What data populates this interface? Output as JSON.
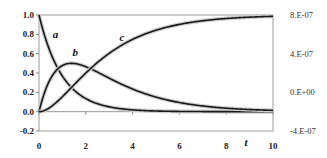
{
  "chart_data": {
    "type": "line",
    "title": "",
    "xlabel": "t",
    "ylabel": "",
    "xlim": [
      0,
      10
    ],
    "ylim": [
      -0.2,
      1.0
    ],
    "y2lim": [
      -4e-07,
      8e-07
    ],
    "x_ticks": [
      "0",
      "2",
      "4",
      "6",
      "8",
      "10"
    ],
    "y_ticks": [
      "1.0",
      "0.8",
      "0.6",
      "0.4",
      "0.2",
      "0.0",
      "-0.2"
    ],
    "y2_ticks": [
      "8.E-07",
      "4.E-07",
      "0.E+00",
      "-4.E-07"
    ],
    "grid": false,
    "legend": "inline labels",
    "x": [
      0,
      0.25,
      0.5,
      0.75,
      1,
      1.25,
      1.5,
      1.75,
      2,
      2.5,
      3,
      3.5,
      4,
      4.5,
      5,
      5.5,
      6,
      6.5,
      7,
      7.5,
      8,
      8.5,
      9,
      9.5,
      10
    ],
    "series": [
      {
        "name": "a",
        "values": [
          1.0,
          0.779,
          0.607,
          0.472,
          0.368,
          0.287,
          0.223,
          0.174,
          0.135,
          0.082,
          0.05,
          0.03,
          0.018,
          0.011,
          0.007,
          0.004,
          0.002,
          0.002,
          0.001,
          0.001,
          0.0,
          0.0,
          0.0,
          0.0,
          0.0
        ]
      },
      {
        "name": "b",
        "values": [
          0.0,
          0.206,
          0.344,
          0.433,
          0.477,
          0.496,
          0.498,
          0.486,
          0.465,
          0.409,
          0.347,
          0.288,
          0.234,
          0.189,
          0.151,
          0.12,
          0.095,
          0.075,
          0.059,
          0.047,
          0.037,
          0.029,
          0.022,
          0.017,
          0.013
        ]
      },
      {
        "name": "c",
        "values": [
          0.0,
          0.015,
          0.049,
          0.095,
          0.155,
          0.217,
          0.279,
          0.34,
          0.4,
          0.509,
          0.603,
          0.682,
          0.748,
          0.8,
          0.842,
          0.876,
          0.903,
          0.923,
          0.94,
          0.952,
          0.963,
          0.971,
          0.978,
          0.983,
          0.987
        ]
      }
    ],
    "annotations": [
      {
        "text": "a",
        "x": 0.7,
        "y": 0.8
      },
      {
        "text": "b",
        "x": 1.55,
        "y": 0.62
      },
      {
        "text": "c",
        "x": 3.55,
        "y": 0.77
      }
    ]
  }
}
